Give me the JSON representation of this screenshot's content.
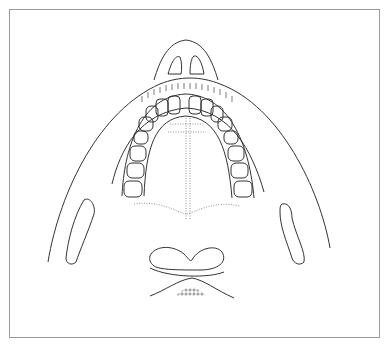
{
  "figure": {
    "type": "anatomical line drawing",
    "colors": {
      "line": "#333333",
      "frame": "#9a9a9a",
      "background": "#ffffff",
      "hatch": "#444444"
    },
    "parts": [
      {
        "name": "chin"
      },
      {
        "name": "dental-arch"
      },
      {
        "name": "palatal-midline-dotted"
      },
      {
        "name": "left-bone-section"
      },
      {
        "name": "right-bone-section"
      },
      {
        "name": "hyoid-hatched"
      },
      {
        "name": "cervical-vertebra-section"
      }
    ]
  }
}
